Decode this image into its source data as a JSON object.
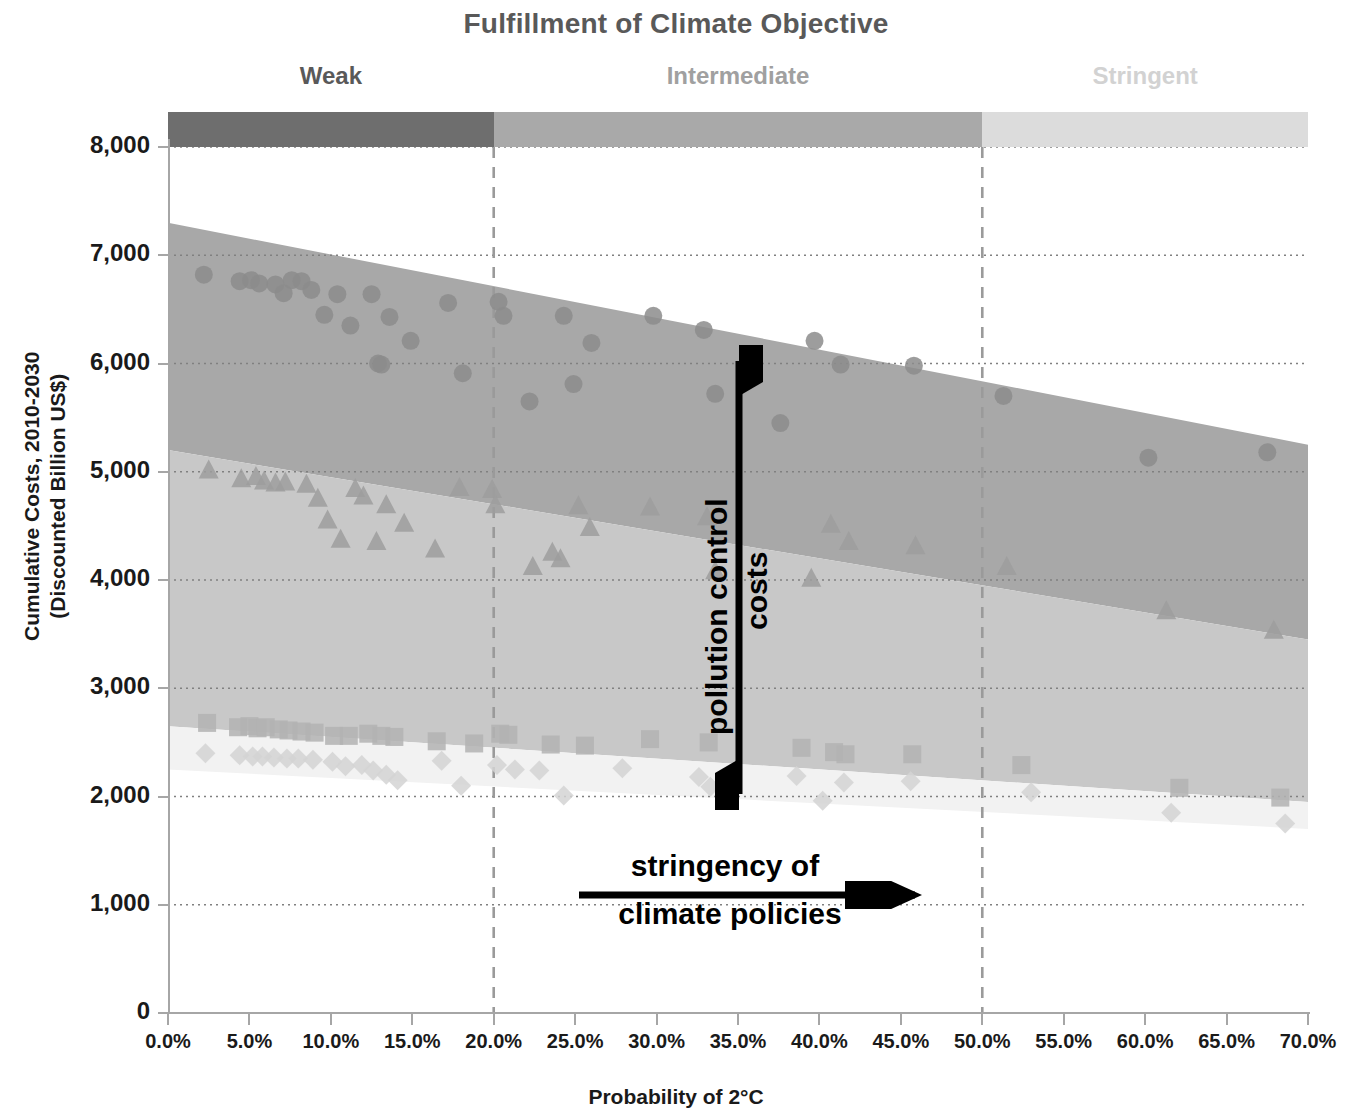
{
  "title": "Fulfillment of Climate Objective",
  "categories": {
    "items": [
      {
        "label": "Weak",
        "color": "#6e6e6e",
        "text_color": "#595959",
        "x_start_pct": 0,
        "x_end_pct": 20
      },
      {
        "label": "Intermediate",
        "color": "#a9a9a9",
        "text_color": "#a0a0a0",
        "x_start_pct": 20,
        "x_end_pct": 50
      },
      {
        "label": "Stringent",
        "color": "#dcdcdc",
        "text_color": "#d2d2d2",
        "x_start_pct": 50,
        "x_end_pct": 70
      }
    ]
  },
  "annotations": {
    "vertical_arrow_label": "pollution control costs",
    "vertical_arrow_line1": "pollution control",
    "vertical_arrow_line2": "costs",
    "horizontal_arrow_line1": "stringency of",
    "horizontal_arrow_line2": "climate policies"
  },
  "chart_data": {
    "type": "scatter",
    "title": "Fulfillment of Climate Objective",
    "xlabel": "Probability of 2°C",
    "ylabel": "Cumulative Costs, 2010-2030 (Discounted Billion US$)",
    "ylabel_line1": "Cumulative Costs, 2010-2030",
    "ylabel_line2": "(Discounted Billion US$)",
    "xlim": [
      0,
      70
    ],
    "ylim": [
      0,
      8000
    ],
    "xticks": [
      0,
      5,
      10,
      15,
      20,
      25,
      30,
      35,
      40,
      45,
      50,
      55,
      60,
      65,
      70
    ],
    "xticklabels": [
      "0.0%",
      "5.0%",
      "10.0%",
      "15.0%",
      "20.0%",
      "25.0%",
      "30.0%",
      "35.0%",
      "40.0%",
      "45.0%",
      "50.0%",
      "55.0%",
      "60.0%",
      "65.0%",
      "70.0%"
    ],
    "yticks": [
      0,
      1000,
      2000,
      3000,
      4000,
      5000,
      6000,
      7000,
      8000
    ],
    "yticklabels": [
      "0",
      "1,000",
      "2,000",
      "3,000",
      "4,000",
      "5,000",
      "6,000",
      "7,000",
      "8,000"
    ],
    "grid": "horizontal-dotted",
    "legend": "none",
    "separators_x": [
      20,
      50
    ],
    "bands": [
      {
        "name": "total costs band",
        "color": "#a8a8a8",
        "top": [
          {
            "x": 0,
            "y": 7300
          },
          {
            "x": 70,
            "y": 5250
          }
        ],
        "bottom": [
          {
            "x": 0,
            "y": 5200
          },
          {
            "x": 70,
            "y": 3450
          }
        ]
      },
      {
        "name": "mitigation costs band",
        "color": "#c8c8c8",
        "top": [
          {
            "x": 0,
            "y": 5200
          },
          {
            "x": 70,
            "y": 3450
          }
        ],
        "bottom": [
          {
            "x": 0,
            "y": 2650
          },
          {
            "x": 70,
            "y": 1950
          }
        ]
      },
      {
        "name": "baseline pollution band",
        "color": "#f2f2f2",
        "top": [
          {
            "x": 0,
            "y": 2650
          },
          {
            "x": 70,
            "y": 1950
          }
        ],
        "bottom": [
          {
            "x": 0,
            "y": 2250
          },
          {
            "x": 70,
            "y": 1700
          }
        ]
      }
    ],
    "series": [
      {
        "name": "Total costs",
        "marker": "circle",
        "color": "#8c8c8c",
        "points": [
          {
            "x": 2.2,
            "y": 6820
          },
          {
            "x": 4.4,
            "y": 6760
          },
          {
            "x": 5.1,
            "y": 6770
          },
          {
            "x": 5.6,
            "y": 6740
          },
          {
            "x": 6.6,
            "y": 6730
          },
          {
            "x": 7.1,
            "y": 6650
          },
          {
            "x": 7.6,
            "y": 6770
          },
          {
            "x": 8.2,
            "y": 6760
          },
          {
            "x": 8.8,
            "y": 6680
          },
          {
            "x": 9.6,
            "y": 6450
          },
          {
            "x": 10.4,
            "y": 6640
          },
          {
            "x": 11.2,
            "y": 6350
          },
          {
            "x": 12.5,
            "y": 6640
          },
          {
            "x": 12.9,
            "y": 6000
          },
          {
            "x": 13.1,
            "y": 5990
          },
          {
            "x": 13.6,
            "y": 6430
          },
          {
            "x": 14.9,
            "y": 6210
          },
          {
            "x": 17.2,
            "y": 6560
          },
          {
            "x": 18.1,
            "y": 5910
          },
          {
            "x": 20.3,
            "y": 6570
          },
          {
            "x": 20.6,
            "y": 6440
          },
          {
            "x": 22.2,
            "y": 5650
          },
          {
            "x": 24.3,
            "y": 6440
          },
          {
            "x": 24.9,
            "y": 5810
          },
          {
            "x": 26.0,
            "y": 6190
          },
          {
            "x": 29.8,
            "y": 6440
          },
          {
            "x": 32.9,
            "y": 6310
          },
          {
            "x": 33.6,
            "y": 5720
          },
          {
            "x": 37.6,
            "y": 5450
          },
          {
            "x": 39.7,
            "y": 6210
          },
          {
            "x": 41.3,
            "y": 5990
          },
          {
            "x": 45.8,
            "y": 5980
          },
          {
            "x": 51.3,
            "y": 5700
          },
          {
            "x": 60.2,
            "y": 5130
          },
          {
            "x": 67.5,
            "y": 5180
          }
        ]
      },
      {
        "name": "Climate policy costs",
        "marker": "triangle",
        "color": "#9e9e9e",
        "points": [
          {
            "x": 2.5,
            "y": 5020
          },
          {
            "x": 4.5,
            "y": 4940
          },
          {
            "x": 5.4,
            "y": 4960
          },
          {
            "x": 5.9,
            "y": 4920
          },
          {
            "x": 6.6,
            "y": 4900
          },
          {
            "x": 7.2,
            "y": 4910
          },
          {
            "x": 8.5,
            "y": 4890
          },
          {
            "x": 9.2,
            "y": 4760
          },
          {
            "x": 9.8,
            "y": 4560
          },
          {
            "x": 10.6,
            "y": 4380
          },
          {
            "x": 11.5,
            "y": 4850
          },
          {
            "x": 12.0,
            "y": 4780
          },
          {
            "x": 12.8,
            "y": 4360
          },
          {
            "x": 13.4,
            "y": 4700
          },
          {
            "x": 14.5,
            "y": 4530
          },
          {
            "x": 16.4,
            "y": 4290
          },
          {
            "x": 17.9,
            "y": 4860
          },
          {
            "x": 19.9,
            "y": 4840
          },
          {
            "x": 20.1,
            "y": 4700
          },
          {
            "x": 22.4,
            "y": 4130
          },
          {
            "x": 23.6,
            "y": 4260
          },
          {
            "x": 24.1,
            "y": 4200
          },
          {
            "x": 25.2,
            "y": 4690
          },
          {
            "x": 25.9,
            "y": 4490
          },
          {
            "x": 29.6,
            "y": 4680
          },
          {
            "x": 33.1,
            "y": 4590
          },
          {
            "x": 33.6,
            "y": 4090
          },
          {
            "x": 39.5,
            "y": 4020
          },
          {
            "x": 40.7,
            "y": 4520
          },
          {
            "x": 41.8,
            "y": 4360
          },
          {
            "x": 45.9,
            "y": 4320
          },
          {
            "x": 51.5,
            "y": 4130
          },
          {
            "x": 61.3,
            "y": 3720
          },
          {
            "x": 67.9,
            "y": 3540
          }
        ]
      },
      {
        "name": "Pollution control costs",
        "marker": "square",
        "color": "#b3b3b3",
        "points": [
          {
            "x": 2.4,
            "y": 2680
          },
          {
            "x": 4.3,
            "y": 2640
          },
          {
            "x": 5.0,
            "y": 2650
          },
          {
            "x": 5.5,
            "y": 2630
          },
          {
            "x": 6.0,
            "y": 2640
          },
          {
            "x": 6.8,
            "y": 2620
          },
          {
            "x": 7.4,
            "y": 2610
          },
          {
            "x": 8.2,
            "y": 2600
          },
          {
            "x": 9.0,
            "y": 2590
          },
          {
            "x": 10.2,
            "y": 2560
          },
          {
            "x": 11.1,
            "y": 2560
          },
          {
            "x": 12.3,
            "y": 2580
          },
          {
            "x": 13.1,
            "y": 2560
          },
          {
            "x": 13.9,
            "y": 2550
          },
          {
            "x": 16.5,
            "y": 2510
          },
          {
            "x": 18.8,
            "y": 2490
          },
          {
            "x": 20.4,
            "y": 2580
          },
          {
            "x": 20.9,
            "y": 2570
          },
          {
            "x": 23.5,
            "y": 2480
          },
          {
            "x": 25.6,
            "y": 2470
          },
          {
            "x": 29.6,
            "y": 2530
          },
          {
            "x": 33.2,
            "y": 2500
          },
          {
            "x": 38.9,
            "y": 2450
          },
          {
            "x": 40.9,
            "y": 2410
          },
          {
            "x": 41.6,
            "y": 2390
          },
          {
            "x": 45.7,
            "y": 2390
          },
          {
            "x": 52.4,
            "y": 2290
          },
          {
            "x": 62.1,
            "y": 2080
          },
          {
            "x": 68.3,
            "y": 1990
          }
        ]
      },
      {
        "name": "Baseline pollution control costs",
        "marker": "diamond",
        "color": "#d4d4d4",
        "points": [
          {
            "x": 2.3,
            "y": 2400
          },
          {
            "x": 4.4,
            "y": 2380
          },
          {
            "x": 5.2,
            "y": 2370
          },
          {
            "x": 5.8,
            "y": 2370
          },
          {
            "x": 6.5,
            "y": 2360
          },
          {
            "x": 7.3,
            "y": 2350
          },
          {
            "x": 8.0,
            "y": 2350
          },
          {
            "x": 8.9,
            "y": 2340
          },
          {
            "x": 10.1,
            "y": 2320
          },
          {
            "x": 10.9,
            "y": 2280
          },
          {
            "x": 11.9,
            "y": 2290
          },
          {
            "x": 12.6,
            "y": 2240
          },
          {
            "x": 13.4,
            "y": 2200
          },
          {
            "x": 14.1,
            "y": 2150
          },
          {
            "x": 16.8,
            "y": 2330
          },
          {
            "x": 18.0,
            "y": 2100
          },
          {
            "x": 20.2,
            "y": 2290
          },
          {
            "x": 21.3,
            "y": 2250
          },
          {
            "x": 22.8,
            "y": 2240
          },
          {
            "x": 24.3,
            "y": 2010
          },
          {
            "x": 27.9,
            "y": 2260
          },
          {
            "x": 32.6,
            "y": 2180
          },
          {
            "x": 33.3,
            "y": 2090
          },
          {
            "x": 38.6,
            "y": 2190
          },
          {
            "x": 40.2,
            "y": 1960
          },
          {
            "x": 41.5,
            "y": 2130
          },
          {
            "x": 45.6,
            "y": 2140
          },
          {
            "x": 53.0,
            "y": 2040
          },
          {
            "x": 61.6,
            "y": 1850
          },
          {
            "x": 68.6,
            "y": 1750
          }
        ]
      }
    ]
  }
}
